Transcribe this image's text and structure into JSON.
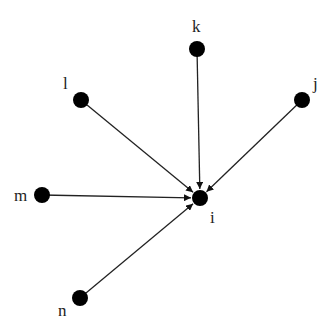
{
  "diagram": {
    "type": "directed-graph",
    "center_node": "i",
    "nodes": [
      {
        "id": "i",
        "label": "i",
        "x": 200,
        "y": 198,
        "lx": 210,
        "ly": 223
      },
      {
        "id": "k",
        "label": "k",
        "x": 197,
        "y": 49,
        "lx": 192,
        "ly": 32
      },
      {
        "id": "l",
        "label": "l",
        "x": 81,
        "y": 100,
        "lx": 63,
        "ly": 89
      },
      {
        "id": "j",
        "label": "j",
        "x": 302,
        "y": 100,
        "lx": 313,
        "ly": 89
      },
      {
        "id": "m",
        "label": "m",
        "x": 42,
        "y": 195,
        "lx": 14,
        "ly": 201
      },
      {
        "id": "n",
        "label": "n",
        "x": 80,
        "y": 298,
        "lx": 58,
        "ly": 316
      }
    ],
    "edges": [
      {
        "from": "k",
        "to": "i"
      },
      {
        "from": "l",
        "to": "i"
      },
      {
        "from": "j",
        "to": "i"
      },
      {
        "from": "m",
        "to": "i"
      },
      {
        "from": "n",
        "to": "i"
      }
    ]
  }
}
